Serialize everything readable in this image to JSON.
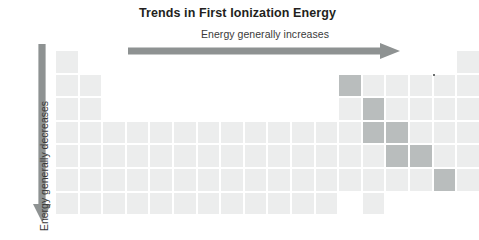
{
  "figure": {
    "title": "Trends in First Ionization Energy",
    "horizontal_label": "Energy generally increases",
    "vertical_label": "Energy  generally decreases",
    "horizontal_arrow_direction": "right",
    "vertical_arrow_direction": "down"
  },
  "colors": {
    "title_text": "#231f20",
    "label_text": "#3a3a3a",
    "arrow": "#8e9292",
    "cell_light": "#eceded",
    "cell_dark": "#b9bdbd",
    "background": "#ffffff"
  },
  "chart_data": {
    "type": "heatmap",
    "title": "Trends in First Ionization Energy",
    "subtitle": "Energy generally increases",
    "xlabel": "Energy generally increases",
    "ylabel": "Energy  generally decreases",
    "grid": "periodic-table",
    "columns": 18,
    "rows": 7,
    "legend_position": "none",
    "categories": [
      "light",
      "dark"
    ],
    "cell_values": {
      "light": 0,
      "dark": 1
    },
    "occupied_cells": [
      {
        "row": 1,
        "cols": [
          1,
          18
        ]
      },
      {
        "row": 2,
        "cols": [
          1,
          2,
          13,
          14,
          15,
          16,
          17,
          18
        ]
      },
      {
        "row": 3,
        "cols": [
          1,
          2,
          13,
          14,
          15,
          16,
          17,
          18
        ]
      },
      {
        "row": 4,
        "cols": [
          1,
          2,
          3,
          4,
          5,
          6,
          7,
          8,
          9,
          10,
          11,
          12,
          13,
          14,
          15,
          16,
          17,
          18
        ]
      },
      {
        "row": 5,
        "cols": [
          1,
          2,
          3,
          4,
          5,
          6,
          7,
          8,
          9,
          10,
          11,
          12,
          13,
          14,
          15,
          16,
          17,
          18
        ]
      },
      {
        "row": 6,
        "cols": [
          1,
          2,
          3,
          4,
          5,
          6,
          7,
          8,
          9,
          10,
          11,
          12,
          13,
          14,
          15,
          16,
          17,
          18
        ]
      },
      {
        "row": 7,
        "cols": [
          1,
          2,
          3,
          4,
          5,
          6,
          7,
          8,
          9,
          10,
          11,
          12,
          14
        ]
      }
    ],
    "highlighted_cells": [
      {
        "row": 2,
        "col": 13
      },
      {
        "row": 3,
        "col": 14
      },
      {
        "row": 4,
        "col": 14
      },
      {
        "row": 4,
        "col": 15
      },
      {
        "row": 5,
        "col": 15
      },
      {
        "row": 5,
        "col": 16
      },
      {
        "row": 6,
        "col": 17
      }
    ],
    "marker_dots": [
      {
        "row": 2,
        "col": 17,
        "position": "top-left"
      }
    ]
  }
}
